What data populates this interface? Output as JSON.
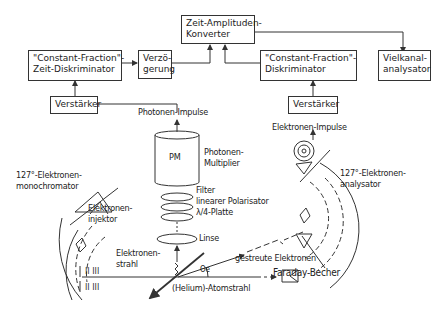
{
  "diagram": {
    "title": "",
    "boxes": {
      "tac": {
        "line1": "Zeit-Amplituden-",
        "line2": "Konverter"
      },
      "cfd_left": {
        "line1": "\"Constant-Fraction\"-",
        "line2": "Zeit-Diskriminator"
      },
      "delay": {
        "line1": "Verzö-",
        "line2": "gerung"
      },
      "cfd_right": {
        "line1": "\"Constant-Fraction\"-",
        "line2": "Diskriminator"
      },
      "mca": {
        "line1": "Vielkanal-",
        "line2": "analysator"
      },
      "amp_left": {
        "label": "Verstärker"
      },
      "amp_right": {
        "label": "Verstärker"
      },
      "pm": {
        "label": "PM"
      }
    },
    "labels": {
      "photon_pulses": "Photonen-Impulse",
      "electron_pulses": "Elektronen-Impulse",
      "pm_line1": "Photonen-",
      "pm_line2": "Multiplier",
      "filter": "Filter",
      "polarizer": "linearer Polarisator",
      "quarter_wave": "λ/4-Platte",
      "lens": "Linse",
      "mono_line1": "127°-Elektronen-",
      "mono_line2": "monochromator",
      "injector_line1": "Elektronen-",
      "injector_line2": "injektor",
      "beam_line1": "Elektronen-",
      "beam_line2": "strahl",
      "scattered": "gestreute Elektronen",
      "faraday": "Faraday-Becher",
      "atom_beam": "(Helium)-Atomstrahl",
      "angle": "Θe",
      "analyzer_line1": "127°-Elektronen-",
      "analyzer_line2": "analysator"
    },
    "colors": {
      "line": "#333333",
      "background": "#ffffff"
    }
  }
}
